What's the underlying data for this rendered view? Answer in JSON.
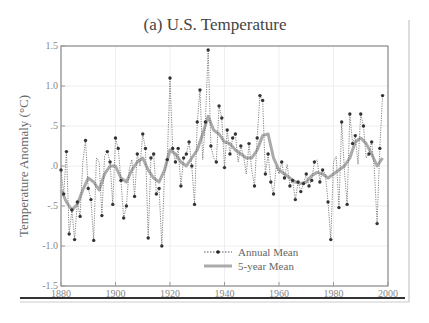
{
  "chart_data": {
    "type": "line",
    "title": "(a)  U.S. Temperature",
    "xlabel": "",
    "ylabel": "Temperature Anomaly (°C)",
    "xlim": [
      1880,
      2000
    ],
    "ylim": [
      -1.5,
      1.5
    ],
    "x_ticks": [
      "1880",
      "1900",
      "1920",
      "1940",
      "1960",
      "1980",
      "2000"
    ],
    "y_ticks": [
      "1.5",
      "1.0",
      ".5",
      ".0",
      "-.5",
      "-1.0",
      "-1.5"
    ],
    "grid": true,
    "legend_position": "lower center",
    "series": [
      {
        "name": "Annual Mean",
        "style": "dotted line with markers",
        "x": [
          1880,
          1881,
          1882,
          1883,
          1884,
          1885,
          1886,
          1887,
          1888,
          1889,
          1890,
          1891,
          1892,
          1893,
          1894,
          1895,
          1896,
          1897,
          1898,
          1899,
          1900,
          1901,
          1902,
          1903,
          1904,
          1905,
          1906,
          1907,
          1908,
          1909,
          1910,
          1911,
          1912,
          1913,
          1914,
          1915,
          1916,
          1917,
          1918,
          1919,
          1920,
          1921,
          1922,
          1923,
          1924,
          1925,
          1926,
          1927,
          1928,
          1929,
          1930,
          1931,
          1932,
          1933,
          1934,
          1935,
          1936,
          1937,
          1938,
          1939,
          1940,
          1941,
          1942,
          1943,
          1944,
          1945,
          1946,
          1947,
          1948,
          1949,
          1950,
          1951,
          1952,
          1953,
          1954,
          1955,
          1956,
          1957,
          1958,
          1959,
          1960,
          1961,
          1962,
          1963,
          1964,
          1965,
          1966,
          1967,
          1968,
          1969,
          1970,
          1971,
          1972,
          1973,
          1974,
          1975,
          1976,
          1977,
          1978,
          1979,
          1980,
          1981,
          1982,
          1983,
          1984,
          1985,
          1986,
          1987,
          1988,
          1989,
          1990,
          1991,
          1992,
          1993,
          1994,
          1995,
          1996,
          1997,
          1998
        ],
        "values": [
          -0.05,
          -0.35,
          0.18,
          -0.85,
          -0.55,
          -0.92,
          -0.45,
          -0.63,
          0.05,
          0.32,
          -0.28,
          -0.42,
          -0.93,
          0.1,
          0.05,
          -0.62,
          0.12,
          0.18,
          0.05,
          -0.48,
          0.35,
          0.22,
          -0.18,
          -0.65,
          -0.5,
          -0.05,
          0.08,
          -0.38,
          0.15,
          0.0,
          0.4,
          0.22,
          -0.9,
          0.1,
          0.15,
          -0.35,
          -0.28,
          -1.0,
          -0.1,
          0.08,
          1.1,
          0.22,
          0.05,
          0.22,
          -0.25,
          0.1,
          0.15,
          0.3,
          0.0,
          -0.48,
          0.55,
          0.95,
          0.08,
          0.55,
          1.45,
          0.25,
          0.1,
          0.05,
          0.75,
          0.6,
          -0.02,
          0.45,
          0.15,
          0.35,
          0.4,
          0.05,
          0.25,
          0.12,
          -0.1,
          0.28,
          -0.05,
          -0.25,
          0.35,
          0.88,
          0.82,
          -0.1,
          0.15,
          -0.2,
          -0.35,
          0.0,
          -0.1,
          0.05,
          -0.15,
          0.02,
          -0.25,
          -0.18,
          -0.42,
          -0.2,
          -0.32,
          -0.22,
          -0.1,
          -0.25,
          -0.18,
          0.05,
          0.08,
          -0.2,
          -0.05,
          -0.1,
          -0.45,
          -0.92,
          0.05,
          0.12,
          -0.52,
          0.55,
          -0.05,
          -0.48,
          0.65,
          0.28,
          0.38,
          0.02,
          0.65,
          0.5,
          0.1,
          0.15,
          0.3,
          -0.05,
          -0.72,
          0.22,
          0.88
        ],
        "color": "#333333"
      },
      {
        "name": "5-year Mean",
        "style": "thick solid line",
        "x": [
          1880,
          1882,
          1884,
          1886,
          1888,
          1890,
          1892,
          1894,
          1896,
          1898,
          1900,
          1902,
          1904,
          1906,
          1908,
          1910,
          1912,
          1914,
          1916,
          1918,
          1920,
          1922,
          1924,
          1926,
          1928,
          1930,
          1932,
          1934,
          1936,
          1938,
          1940,
          1942,
          1944,
          1946,
          1948,
          1950,
          1952,
          1954,
          1956,
          1958,
          1960,
          1962,
          1964,
          1966,
          1968,
          1970,
          1972,
          1974,
          1976,
          1978,
          1980,
          1982,
          1984,
          1986,
          1988,
          1990,
          1992,
          1994,
          1996,
          1998
        ],
        "values": [
          -0.3,
          -0.45,
          -0.55,
          -0.48,
          -0.3,
          -0.15,
          -0.2,
          -0.3,
          -0.1,
          0.0,
          0.0,
          -0.15,
          -0.2,
          -0.05,
          0.05,
          0.1,
          -0.05,
          -0.15,
          -0.2,
          -0.05,
          0.2,
          0.15,
          0.05,
          0.0,
          0.1,
          0.2,
          0.4,
          0.62,
          0.45,
          0.4,
          0.3,
          0.28,
          0.2,
          0.15,
          0.1,
          0.1,
          0.2,
          0.38,
          0.4,
          0.1,
          -0.05,
          -0.1,
          -0.15,
          -0.2,
          -0.22,
          -0.2,
          -0.12,
          -0.08,
          -0.1,
          -0.15,
          -0.1,
          -0.05,
          0.0,
          0.1,
          0.3,
          0.35,
          0.28,
          0.15,
          0.0,
          0.1
        ],
        "color": "#aaaaaa"
      }
    ]
  },
  "legend": {
    "annual_label": "Annual Mean",
    "five_year_label": "5-year Mean"
  }
}
